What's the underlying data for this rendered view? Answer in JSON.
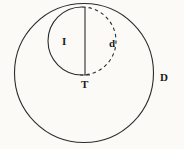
{
  "figure": {
    "background_color": "#fbfaf7",
    "stroke_color": "#2b2b2b",
    "labels": {
      "outer_circle": "D",
      "inner_left_arc": "I",
      "inner_right_arc": "d",
      "bottom_point": "T"
    }
  },
  "chart_data": {
    "type": "diagram",
    "shapes": [
      {
        "name": "outer-circle",
        "kind": "circle",
        "label": "D",
        "cx": 84,
        "cy": 73,
        "r": 69.5,
        "stroke": "#2b2b2b",
        "stroke_width": 1,
        "dash": "solid",
        "fill": "none"
      },
      {
        "name": "inner-circle-left-arc",
        "kind": "arc",
        "label": "I",
        "cx": 82,
        "cy": 41,
        "r": 34,
        "stroke": "#2b2b2b",
        "stroke_width": 1,
        "dash": "solid",
        "fill": "none",
        "arc_side": "left"
      },
      {
        "name": "inner-circle-right-arc",
        "kind": "arc",
        "label": "d",
        "cx": 82,
        "cy": 41,
        "r": 34,
        "stroke": "#2b2b2b",
        "stroke_width": 1,
        "dash": "dashed",
        "fill": "none",
        "arc_side": "right"
      },
      {
        "name": "vertical-chord",
        "kind": "line",
        "x1": 85,
        "y1": 7,
        "x2": 85,
        "y2": 75,
        "stroke": "#2b2b2b",
        "stroke_width": 1,
        "dash": "solid"
      }
    ],
    "points": [
      {
        "name": "top-junction",
        "x": 85,
        "y": 7,
        "label": ""
      },
      {
        "name": "bottom-point",
        "x": 85,
        "y": 75,
        "label": "T"
      }
    ],
    "annotations": [
      {
        "name": "label-I",
        "text": "I",
        "x": 66,
        "y": 42
      },
      {
        "name": "label-d",
        "text": "d",
        "x": 113,
        "y": 44
      },
      {
        "name": "label-T",
        "text": "T",
        "x": 85,
        "y": 85
      },
      {
        "name": "label-D",
        "text": "D",
        "x": 164,
        "y": 78
      }
    ],
    "xlim": [
      0,
      184
    ],
    "ylim": [
      0,
      149
    ],
    "grid": false,
    "legend": "none"
  }
}
